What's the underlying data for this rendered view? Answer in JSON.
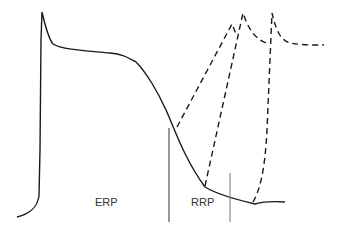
{
  "diagram": {
    "labels": {
      "erp": "ERP",
      "rrp": "RRP"
    },
    "colors": {
      "trace": "#1a1a1a",
      "marker": "#555555",
      "background": "#ffffff"
    },
    "main_trace": "action-potential",
    "dashed_traces": [
      "response-during-early-RRP",
      "response-during-late-RRP",
      "response-after-RRP"
    ]
  }
}
